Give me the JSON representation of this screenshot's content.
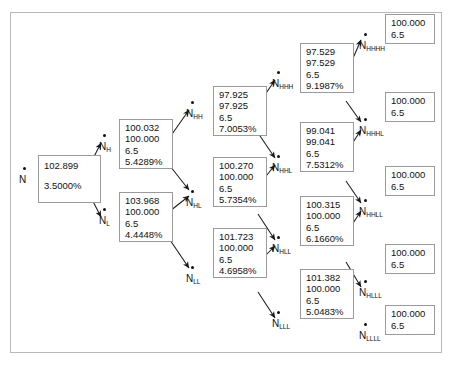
{
  "diagram": {
    "type": "binomial-interest-rate-tree",
    "frame_border_color": "#b8b8b8",
    "box_border_color": "#9a9a9a",
    "text_color": "#111111"
  },
  "nodes": {
    "root": {
      "id": "N",
      "label": "N",
      "subscript": "",
      "value": "102.899",
      "rate": "3.5000%",
      "lines": [
        "102.899",
        "3.5000%"
      ]
    },
    "h": {
      "id": "N_H",
      "label": "N",
      "subscript": "H",
      "lines": [
        "100.032",
        "100.000",
        "6.5",
        "5.4289%"
      ]
    },
    "l": {
      "id": "N_L",
      "label": "N",
      "subscript": "L",
      "lines": [
        "103.968",
        "100.000",
        "6.5",
        "4.4448%"
      ]
    },
    "hh": {
      "id": "N_HH",
      "label": "N",
      "subscript": "HH",
      "lines": [
        "97.925",
        "97.925",
        "6.5",
        "7.0053%"
      ]
    },
    "hl": {
      "id": "N_HL",
      "label": "N",
      "subscript": "HL",
      "lines": [
        "100.270",
        "100.000",
        "6.5",
        "5.7354%"
      ]
    },
    "ll": {
      "id": "N_LL",
      "label": "N",
      "subscript": "LL",
      "lines": [
        "101.723",
        "100.000",
        "6.5",
        "4.6958%"
      ]
    },
    "hhh": {
      "id": "N_HHH",
      "label": "N",
      "subscript": "HHH",
      "lines": [
        "97.529",
        "97.529",
        "6.5",
        "9.1987%"
      ]
    },
    "hhl": {
      "id": "N_HHL",
      "label": "N",
      "subscript": "HHL",
      "lines": [
        "99.041",
        "99.041",
        "6.5",
        "7.5312%"
      ]
    },
    "hll": {
      "id": "N_HLL",
      "label": "N",
      "subscript": "HLL",
      "lines": [
        "100.315",
        "100.000",
        "6.5",
        "6.1660%"
      ]
    },
    "lll": {
      "id": "N_LLL",
      "label": "N",
      "subscript": "LLL",
      "lines": [
        "101.382",
        "100.000",
        "6.5",
        "5.0483%"
      ]
    },
    "hhhh": {
      "id": "N_HHHH",
      "label": "N",
      "subscript": "HHHH",
      "lines": [
        "100.000",
        "6.5"
      ]
    },
    "hhhl": {
      "id": "N_HHHL",
      "label": "N",
      "subscript": "HHHL",
      "lines": [
        "100.000",
        "6.5"
      ]
    },
    "hhll": {
      "id": "N_HHLL",
      "label": "N",
      "subscript": "HHLL",
      "lines": [
        "100.000",
        "6.5"
      ]
    },
    "hlll": {
      "id": "N_HLLL",
      "label": "N",
      "subscript": "HLLL",
      "lines": [
        "100.000",
        "6.5"
      ]
    },
    "llll": {
      "id": "N_LLLL",
      "label": "N",
      "subscript": "LLLL",
      "lines": [
        "100.000",
        "6.5"
      ]
    }
  }
}
